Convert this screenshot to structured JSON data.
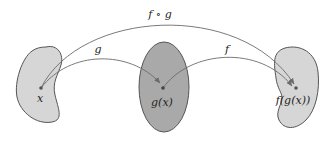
{
  "diagram": {
    "sets": [
      {
        "id": "domain-g",
        "shape": "blob",
        "fill": "#d6d6d6"
      },
      {
        "id": "codomain-g",
        "shape": "ellipse",
        "fill": "#a9a9a9"
      },
      {
        "id": "codomain-f",
        "shape": "blob",
        "fill": "#d6d6d6"
      }
    ],
    "points": [
      {
        "id": "x",
        "label": "x"
      },
      {
        "id": "gx",
        "label": "g(x)"
      },
      {
        "id": "fgx",
        "label": "f(g(x))"
      }
    ],
    "arrows": [
      {
        "id": "g",
        "label": "g",
        "from": "x",
        "to": "gx"
      },
      {
        "id": "f",
        "label": "f",
        "from": "gx",
        "to": "fgx"
      },
      {
        "id": "fog",
        "label": "f ∘ g",
        "from": "x",
        "to": "fgx"
      }
    ],
    "colors": {
      "stroke": "#555555",
      "arrow": "#6b6b6b",
      "dot": "#555555",
      "text": "#222222"
    }
  }
}
